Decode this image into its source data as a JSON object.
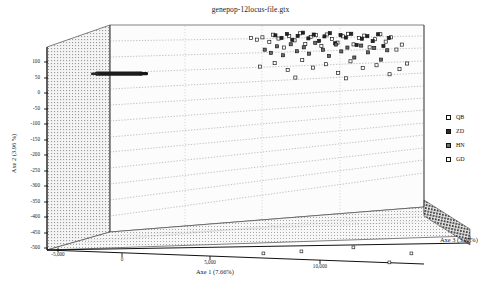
{
  "title": "genepop-12locus-file.gtx",
  "axes": {
    "y": {
      "name": "Axe 2 (3.96 %)",
      "ticks": [
        "100",
        "50",
        "0",
        "-50",
        "-100",
        "-150",
        "-200",
        "-250",
        "-300",
        "-350",
        "-400",
        "-450",
        "-500"
      ],
      "range": [
        -500,
        100
      ]
    },
    "x": {
      "name": "Axe 1  (7.66%)",
      "ticks": [
        "-5,000",
        "0",
        "5,000",
        "10,000"
      ],
      "range": [
        -7500,
        13000
      ]
    },
    "z": {
      "name": "Axe 3  (3.07%)"
    }
  },
  "legend": {
    "items": [
      {
        "label": "QB",
        "style": "open"
      },
      {
        "label": "ZD",
        "style": "dark"
      },
      {
        "label": "HN",
        "style": "gray"
      },
      {
        "label": "GD",
        "style": "open"
      }
    ]
  },
  "chart_data": {
    "type": "scatter",
    "title": "genepop-12locus-file.gtx",
    "xlabel": "Axe 1  (7.66%)",
    "ylabel": "Axe 2 (3.96 %)",
    "zlabel": "Axe 3  (3.07%)",
    "projection": "3d",
    "grid": true,
    "legend_position": "right",
    "xlim": [
      -7500,
      13000
    ],
    "ylim": [
      -500,
      100
    ],
    "series": [
      {
        "name": "QB",
        "style": "open",
        "points": [
          [
            1700,
            60
          ],
          [
            2100,
            55
          ],
          [
            2450,
            62
          ],
          [
            2900,
            48
          ],
          [
            3150,
            70
          ],
          [
            3500,
            58
          ],
          [
            3850,
            30
          ],
          [
            4200,
            66
          ],
          [
            4550,
            52
          ],
          [
            4900,
            74
          ],
          [
            5250,
            40
          ],
          [
            5600,
            62
          ],
          [
            5950,
            68
          ],
          [
            6300,
            34
          ],
          [
            6650,
            70
          ],
          [
            7000,
            56
          ],
          [
            7350,
            44
          ],
          [
            7700,
            64
          ],
          [
            8050,
            72
          ],
          [
            8400,
            38
          ],
          [
            8750,
            58
          ],
          [
            9100,
            66
          ],
          [
            9450,
            28
          ],
          [
            9800,
            54
          ],
          [
            10150,
            70
          ],
          [
            10500,
            46
          ],
          [
            10850,
            60
          ],
          [
            11200,
            20
          ],
          [
            11550,
            36
          ]
        ]
      },
      {
        "name": "ZD",
        "style": "dark",
        "points": [
          [
            3300,
            68
          ],
          [
            3700,
            60
          ],
          [
            4050,
            72
          ],
          [
            4400,
            54
          ],
          [
            4750,
            66
          ],
          [
            5100,
            76
          ],
          [
            5450,
            58
          ],
          [
            5800,
            70
          ],
          [
            6150,
            50
          ],
          [
            6500,
            64
          ],
          [
            6850,
            74
          ],
          [
            7200,
            42
          ],
          [
            7550,
            68
          ],
          [
            7900,
            60
          ],
          [
            8250,
            72
          ],
          [
            8600,
            36
          ],
          [
            8950,
            56
          ],
          [
            9300,
            64
          ],
          [
            9650,
            48
          ],
          [
            10000,
            70
          ],
          [
            10350,
            32
          ],
          [
            10700,
            58
          ]
        ]
      },
      {
        "name": "HN",
        "style": "gray",
        "points": [
          [
            2600,
            24
          ],
          [
            3000,
            14
          ],
          [
            3400,
            34
          ],
          [
            3800,
            6
          ],
          [
            4300,
            40
          ],
          [
            4700,
            18
          ],
          [
            5150,
            30
          ],
          [
            5500,
            10
          ],
          [
            5900,
            44
          ],
          [
            6400,
            22
          ],
          [
            6800,
            2
          ],
          [
            7250,
            38
          ],
          [
            7600,
            16
          ],
          [
            8000,
            28
          ],
          [
            8450,
            -4
          ],
          [
            8900,
            34
          ],
          [
            9350,
            12
          ],
          [
            9750,
            26
          ],
          [
            10200,
            -12
          ],
          [
            10600,
            18
          ]
        ]
      },
      {
        "name": "GD",
        "style": "open",
        "points": [
          [
            2300,
            -28
          ],
          [
            3250,
            -18
          ],
          [
            4100,
            -40
          ],
          [
            5050,
            -10
          ],
          [
            5750,
            -34
          ],
          [
            6600,
            -24
          ],
          [
            7400,
            -52
          ],
          [
            8200,
            -16
          ],
          [
            9000,
            -38
          ],
          [
            9900,
            -30
          ],
          [
            10750,
            -60
          ],
          [
            11400,
            -44
          ],
          [
            4600,
            -64
          ],
          [
            7900,
            -70
          ],
          [
            11900,
            -26
          ]
        ]
      }
    ],
    "annotations": [
      {
        "type": "dense-bar",
        "note": "thick dark horizontal cluster at left near y=0"
      }
    ]
  }
}
